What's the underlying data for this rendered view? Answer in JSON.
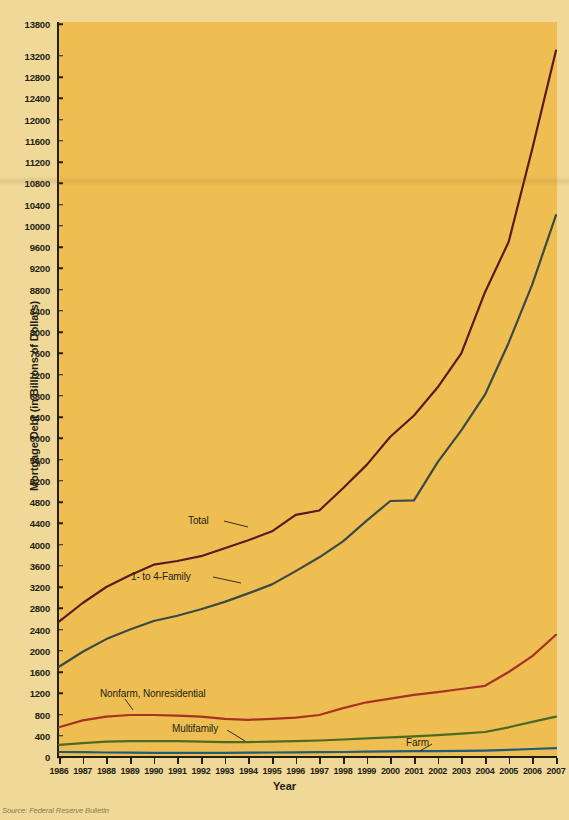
{
  "figure": {
    "y_axis_title": "Mortgage Debt (in Billions of Dollars)",
    "x_axis_title": "Year",
    "source": "Source: Federal Reserve Bulletin"
  },
  "series_labels": {
    "total": "Total",
    "one_to_four": "1-  to 4-Family",
    "nonfarm": "Nonfarm, Nonresidential",
    "multifamily": "Multifamily",
    "farm": "Farm"
  },
  "colors": {
    "background_page": "#f0d898",
    "background_plot": "#eebe52",
    "axis": "#231f14",
    "total": "#5c1a1e",
    "one_to_four": "#3a4a44",
    "nonfarm": "#a83224",
    "multifamily": "#4a6b24",
    "farm": "#1e5c78"
  },
  "bleed_text": {
    "lines": [
      "with a lower interest rate. The lender may be willing to lower",
      "the rate rather than lose the loan entirely. The lender may also",
      "be willing to extend the loan term or add the missed payments",
      "to the end of the loan. Borrowers should contact the lender as",
      "soon as they realize they cannot make a payment."
    ],
    "heading_1": "Types of Residential Mortgages",
    "bullets": [
      "Fixed-rate mortgages",
      "Adjustable-rate mortgages",
      "Balloon mortgages",
      "Reverse mortgages"
    ],
    "heading_2": "Fixed-Rate Mortgages",
    "para_2": [
      "With a fixed-rate mortgage the interest rate remains constant",
      "over the life of the loan. A 30-year mortgage has been the",
      "standard, but 15-year and 20-year terms are also available.",
      "The shorter the term, the higher the monthly payment but the",
      "lower the total interest paid over the life of the loan. Many",
      "borrowers choose fixed-rate loans for the payment certainty"
    ],
    "heading_3": "Adjustable-Rate Mortgage (ARM)",
    "para_3": [
      "An adjustable-rate mortgage has an interest rate that changes",
      "periodically based on an index. The initial rate is usually",
      "lower than that of a comparable fixed-rate loan, which makes",
      "the monthly payment lower at the start of the loan."
    ]
  },
  "chart_data": {
    "type": "line",
    "title": "",
    "xlabel": "Year",
    "ylabel": "Mortgage Debt (in Billions of Dollars)",
    "grid": false,
    "legend": "inline-annotations",
    "xlim": [
      1986,
      2007
    ],
    "ylim": [
      0,
      13800
    ],
    "ytick_step": 400,
    "yticks": [
      0,
      400,
      800,
      1200,
      1600,
      2000,
      2400,
      2800,
      3200,
      3600,
      4000,
      4400,
      4800,
      5200,
      5600,
      6000,
      6400,
      6800,
      7200,
      7600,
      8000,
      8400,
      8800,
      9200,
      9600,
      10000,
      10400,
      10800,
      11200,
      11600,
      12000,
      12400,
      12800,
      13200,
      13800
    ],
    "categories": [
      1986,
      1987,
      1988,
      1989,
      1990,
      1991,
      1992,
      1993,
      1994,
      1995,
      1996,
      1997,
      1998,
      1999,
      2000,
      2001,
      2002,
      2003,
      2004,
      2005,
      2006,
      2007
    ],
    "series": [
      {
        "name": "Total",
        "color": "#5c1a1e",
        "values": [
          2550,
          2900,
          3200,
          3420,
          3620,
          3690,
          3780,
          3930,
          4080,
          4250,
          4560,
          4640,
          5060,
          5500,
          6030,
          6430,
          6960,
          7600,
          8750,
          9700,
          11450,
          13300
        ]
      },
      {
        "name": "1-  to 4-Family",
        "color": "#3a4a44",
        "values": [
          1700,
          1980,
          2220,
          2400,
          2560,
          2660,
          2780,
          2920,
          3080,
          3250,
          3500,
          3760,
          4060,
          4450,
          4820,
          4830,
          5550,
          6150,
          6820,
          7800,
          8900,
          10200
        ]
      },
      {
        "name": "Nonfarm, Nonresidential",
        "color": "#a83224",
        "values": [
          560,
          690,
          760,
          790,
          790,
          780,
          760,
          720,
          700,
          720,
          740,
          790,
          920,
          1030,
          1100,
          1170,
          1220,
          1280,
          1340,
          1600,
          1900,
          2300
        ]
      },
      {
        "name": "Multifamily",
        "color": "#4a6b24",
        "values": [
          230,
          260,
          290,
          300,
          300,
          300,
          290,
          280,
          280,
          290,
          300,
          310,
          330,
          350,
          370,
          390,
          410,
          440,
          470,
          560,
          660,
          760
        ]
      },
      {
        "name": "Farm",
        "color": "#1e5c78",
        "values": [
          95,
          90,
          85,
          82,
          80,
          80,
          80,
          80,
          82,
          85,
          88,
          90,
          95,
          100,
          105,
          110,
          112,
          115,
          120,
          135,
          150,
          165
        ]
      }
    ]
  }
}
